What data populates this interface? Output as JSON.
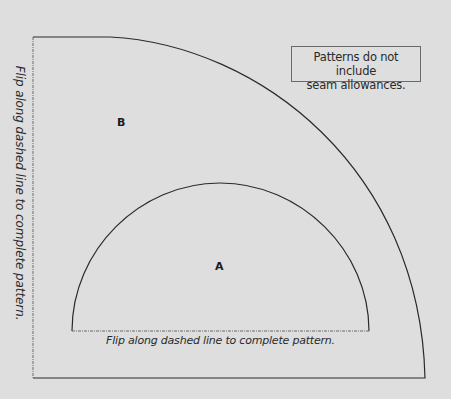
{
  "diagram": {
    "type": "sewing-pattern",
    "note": {
      "line1": "Patterns do not include",
      "line2": "seam allowances."
    },
    "pieces": [
      {
        "id": "B",
        "label": "B",
        "shape": "quarter-circle (outer)"
      },
      {
        "id": "A",
        "label": "A",
        "shape": "half-circle (inner)"
      }
    ],
    "instructions": {
      "horizontal_fold": "Flip along dashed line to complete pattern.",
      "vertical_fold": "Flip along dashed line to complete pattern."
    },
    "colors": {
      "background": "#dedede",
      "solid_line": "#2a2a2a",
      "dashed_line": "#6a6a6a"
    }
  }
}
